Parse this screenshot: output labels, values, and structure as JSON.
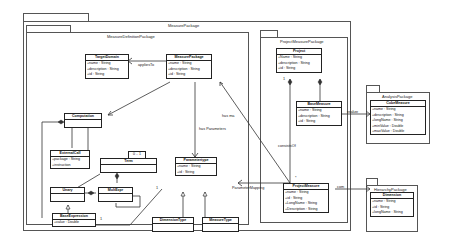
{
  "packages": {
    "measure_package": {
      "title": "MeasurePackage"
    },
    "measure_definition_package": {
      "title": "MeasureDefinitionPackage"
    },
    "project_measure_package": {
      "title": "ProjectMeasurePackage"
    },
    "analysis_package": {
      "title": "AnalysisPackage"
    },
    "hierarchy_package": {
      "title": "HierarchyPackage"
    }
  },
  "classes": {
    "target_domain": {
      "name": "TargetDomain",
      "attrs": [
        "+name : String",
        "+description : String",
        "+id : String"
      ]
    },
    "measure_package": {
      "name": "MeasurePackage",
      "attrs": [
        "+name : String",
        "+description : String",
        "+id : String"
      ]
    },
    "computation": {
      "name": "Computation",
      "attrs": []
    },
    "external_call": {
      "name": "ExternalCall",
      "attrs": [
        "+package : String",
        "+instruction"
      ]
    },
    "term": {
      "name": "Term",
      "attrs": []
    },
    "unary": {
      "name": "Unary",
      "attrs": []
    },
    "mult_expr": {
      "name": "MultExpr",
      "attrs": []
    },
    "base_expression": {
      "name": "BaseExpression",
      "attrs": [
        "+value : Double"
      ]
    },
    "parameter_type": {
      "name": "Parametertype",
      "attrs": [
        "+name : String",
        "+id : String"
      ]
    },
    "dimension_type": {
      "name": "DimensionType",
      "attrs": []
    },
    "measure_type": {
      "name": "MeasureType",
      "attrs": []
    },
    "project": {
      "name": "Project",
      "attrs": [
        "+Name : String",
        "+description : String",
        "+id : String"
      ]
    },
    "base_measure": {
      "name": "BaseMeasure",
      "attrs": [
        "+name : String",
        "+description : String",
        "+id : String"
      ]
    },
    "project_measure": {
      "name": "ProjectMeasure",
      "attrs": [
        "+name : String",
        "+id : String",
        "+LongName : String",
        "+Description : String"
      ]
    },
    "cube_measure": {
      "name": "CubeMeasure",
      "attrs": [
        "+name : String",
        "+description : String",
        "+longName : String",
        "+minValue : Double",
        "+maxValue : Double"
      ]
    },
    "dimension": {
      "name": "Dimension",
      "attrs": [
        "+name : String",
        "+id : String",
        "+longName : String"
      ]
    }
  },
  "relations": {
    "applies_to": "appliesTo",
    "has_parameters": "has Parameters",
    "has_ma": "has ma",
    "consists_of": "consistsOf",
    "parameter_mapping": "ParameterMapping",
    "realize": "realize",
    "com": "com"
  },
  "multiplicities": {
    "term_note": "0 .. 1",
    "base_expr_one": "1",
    "param_one": "1",
    "project_one": "1",
    "pm_star": "*"
  }
}
